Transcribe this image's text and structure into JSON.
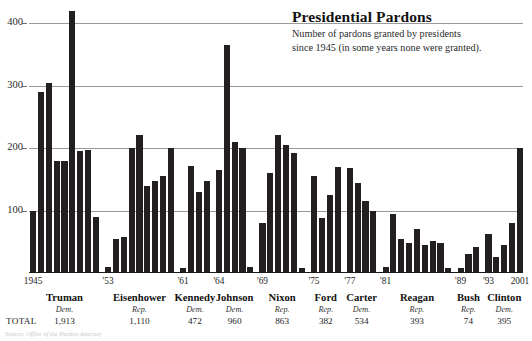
{
  "chart_data": {
    "type": "bar",
    "title": "Presidential Pardons",
    "subtitle_line1": "Number of pardons granted by presidents",
    "subtitle_line2": "since 1945 (in some years none were granted).",
    "xlabel": "",
    "ylabel": "",
    "ylim": [
      0,
      420
    ],
    "grid": true,
    "legend": "none",
    "yticks": [
      100,
      200,
      300,
      400
    ],
    "axis_year_ticks": [
      {
        "label": "1945",
        "year": 1945
      },
      {
        "label": "'53",
        "year": 1953
      },
      {
        "label": "'53",
        "year": 1953
      },
      {
        "label": "'61",
        "year": 1961
      },
      {
        "label": "'61",
        "year": 1961
      },
      {
        "label": "'64",
        "year": 1964
      },
      {
        "label": "'64",
        "year": 1964
      },
      {
        "label": "'69",
        "year": 1969
      },
      {
        "label": "'69",
        "year": 1969
      },
      {
        "label": "'75",
        "year": 1975
      },
      {
        "label": "'75",
        "year": 1975
      },
      {
        "label": "'77",
        "year": 1977
      },
      {
        "label": "'77",
        "year": 1977
      },
      {
        "label": "'81",
        "year": 1981
      },
      {
        "label": "'81",
        "year": 1981
      },
      {
        "label": "'89",
        "year": 1989
      },
      {
        "label": "'89",
        "year": 1989
      },
      {
        "label": "'93",
        "year": 1993
      },
      {
        "label": "'93",
        "year": 1993
      },
      {
        "label": "2001",
        "year": 2001
      }
    ],
    "presidents": [
      {
        "name": "Truman",
        "party": "Dem.",
        "total": "1,913",
        "start_year": 1945,
        "end_year": 1953,
        "values": [
          100,
          290,
          305,
          180,
          180,
          420,
          195,
          198,
          90
        ]
      },
      {
        "name": "Eisenhower",
        "party": "Rep.",
        "total": "1,110",
        "start_year": 1953,
        "end_year": 1961,
        "values": [
          10,
          55,
          57,
          200,
          222,
          140,
          148,
          155,
          200
        ]
      },
      {
        "name": "Kennedy",
        "party": "Dem.",
        "total": "472",
        "start_year": 1961,
        "end_year": 1964,
        "values": [
          8,
          172,
          130,
          148
        ]
      },
      {
        "name": "Johnson",
        "party": "Dem.",
        "total": "960",
        "start_year": 1964,
        "end_year": 1969,
        "values": [
          165,
          365,
          210,
          200,
          10
        ]
      },
      {
        "name": "Nixon",
        "party": "Rep.",
        "total": "863",
        "start_year": 1969,
        "end_year": 1975,
        "values": [
          80,
          160,
          222,
          205,
          193,
          8
        ]
      },
      {
        "name": "Ford",
        "party": "Rep.",
        "total": "382",
        "start_year": 1975,
        "end_year": 1977,
        "values": [
          155,
          88,
          125,
          170
        ]
      },
      {
        "name": "Carter",
        "party": "Dem.",
        "total": "534",
        "start_year": 1977,
        "end_year": 1981,
        "values": [
          168,
          145,
          115,
          100
        ]
      },
      {
        "name": "Reagan",
        "party": "Rep.",
        "total": "393",
        "start_year": 1981,
        "end_year": 1989,
        "values": [
          10,
          95,
          55,
          48,
          70,
          45,
          52,
          48,
          8
        ]
      },
      {
        "name": "Bush",
        "party": "Rep.",
        "total": "74",
        "start_year": 1989,
        "end_year": 1993,
        "values": [
          8,
          30,
          42
        ]
      },
      {
        "name": "Clinton",
        "party": "Dem.",
        "total": "395",
        "start_year": 1993,
        "end_year": 2001,
        "values": [
          62,
          25,
          45,
          80,
          200
        ]
      }
    ]
  },
  "source": "Source: Office of the Pardon Attorney"
}
